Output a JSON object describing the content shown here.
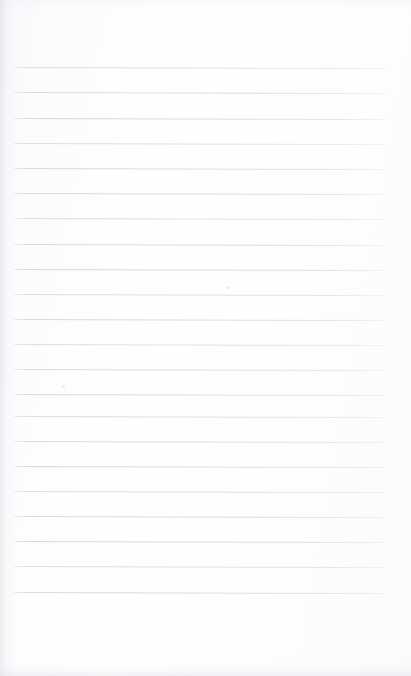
{
  "document": {
    "kind": "scanned-ruled-notebook-page",
    "content_text": "",
    "written_content": "none",
    "page_width_px": 411,
    "page_height_px": 676,
    "background_color": "#fcfcfd",
    "paper_tint": "#ffffff"
  },
  "ruling": {
    "line_color": "#d6d9df",
    "line_thickness_px": 1,
    "line_count": 22,
    "line_spacing_px": 25.3,
    "first_line_y_px": 67,
    "last_line_y_px": 618,
    "line_start_x_px": 14,
    "line_end_x_px": 385,
    "line_length_px": 371,
    "skew_degrees": 0.16,
    "top_margin_px": 67,
    "bottom_margin_px": 58,
    "left_margin_px": 14,
    "right_margin_px": 26,
    "lines_y_px": [
      67,
      92,
      118,
      143,
      168,
      193,
      218,
      244,
      269,
      294,
      319,
      344,
      369,
      394,
      416,
      441,
      466,
      491,
      516,
      541,
      566,
      592
    ]
  },
  "artifacts": {
    "left_edge_shadow": "#d2d6de",
    "bottom_edge_shadow": "#d6dae2",
    "specks": [
      {
        "x_px": 227,
        "y_px": 286,
        "size_px": 3
      },
      {
        "x_px": 62,
        "y_px": 385,
        "size_px": 3
      }
    ]
  }
}
